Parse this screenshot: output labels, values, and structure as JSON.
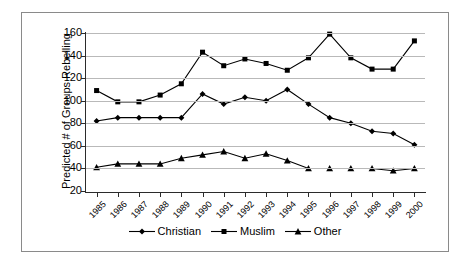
{
  "chart_data": {
    "type": "line",
    "title": "",
    "xlabel": "",
    "ylabel": "Predicted # of Groups Rebelling",
    "categories": [
      "1985",
      "1986",
      "1987",
      "1988",
      "1989",
      "1990",
      "1991",
      "1992",
      "1993",
      "1994",
      "1995",
      "1996",
      "1997",
      "1998",
      "1999",
      "2000"
    ],
    "ylim": [
      20,
      160
    ],
    "ytick_values": [
      20,
      40,
      60,
      80,
      100,
      120,
      140,
      160
    ],
    "ytick_labels": [
      "20",
      "40",
      "60",
      "80",
      "100",
      "120",
      "140",
      "160"
    ],
    "grid": true,
    "legend_position": "bottom",
    "series": [
      {
        "name": "Christian",
        "marker": "diamond",
        "color": "#000000",
        "values": [
          82,
          85,
          85,
          85,
          85,
          106,
          97,
          103,
          100,
          110,
          97,
          85,
          80,
          73,
          71,
          61
        ]
      },
      {
        "name": "Muslim",
        "marker": "square",
        "color": "#000000",
        "values": [
          109,
          99,
          99,
          105,
          115,
          143,
          131,
          137,
          133,
          127,
          138,
          159,
          138,
          128,
          128,
          153
        ]
      },
      {
        "name": "Other",
        "marker": "triangle",
        "color": "#000000",
        "values": [
          41,
          44,
          44,
          44,
          49,
          52,
          55,
          49,
          53,
          47,
          40,
          40,
          40,
          40,
          38,
          40
        ]
      }
    ]
  },
  "legend": {
    "items": [
      {
        "label": "Christian",
        "marker": "diamond"
      },
      {
        "label": "Muslim",
        "marker": "square"
      },
      {
        "label": "Other",
        "marker": "triangle"
      }
    ]
  }
}
